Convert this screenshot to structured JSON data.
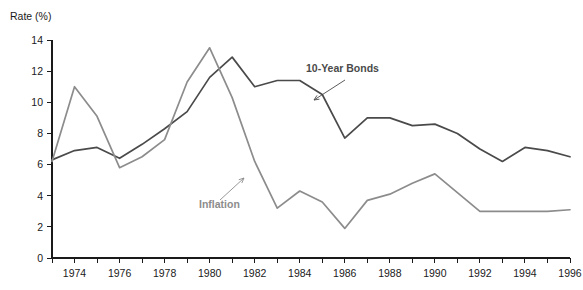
{
  "chart_data": {
    "type": "line",
    "title": "",
    "xlabel": "",
    "ylabel": "Rate (%)",
    "ylim": [
      0,
      14
    ],
    "xlim": [
      1973,
      1996
    ],
    "yticks": [
      0,
      2,
      4,
      6,
      8,
      10,
      12,
      14
    ],
    "ytick_labels": [
      "0",
      "2",
      "4",
      "6",
      "8",
      "10",
      "12",
      "14"
    ],
    "x": [
      1973,
      1974,
      1975,
      1976,
      1977,
      1978,
      1979,
      1980,
      1981,
      1982,
      1983,
      1984,
      1985,
      1986,
      1987,
      1988,
      1989,
      1990,
      1991,
      1992,
      1993,
      1994,
      1995,
      1996
    ],
    "xtick_values": [
      1973,
      1974,
      1975,
      1976,
      1977,
      1978,
      1979,
      1980,
      1981,
      1982,
      1983,
      1984,
      1985,
      1986,
      1987,
      1988,
      1989,
      1990,
      1991,
      1992,
      1993,
      1994,
      1995,
      1996
    ],
    "xtick_labels_shown": [
      "1974",
      "1976",
      "1978",
      "1980",
      "1982",
      "1984",
      "1986",
      "1988",
      "1990",
      "1992",
      "1994",
      "1996"
    ],
    "grid": false,
    "legend_position": "inline-annotation",
    "series": [
      {
        "name": "10-Year Bonds",
        "color": "#4a4a4a",
        "values": [
          6.3,
          6.9,
          7.1,
          6.4,
          7.3,
          8.3,
          9.4,
          11.6,
          12.9,
          11.0,
          11.4,
          11.4,
          10.5,
          7.7,
          9.0,
          9.0,
          8.5,
          8.6,
          8.0,
          7.0,
          6.2,
          7.1,
          6.9,
          6.5
        ]
      },
      {
        "name": "Inflation",
        "color": "#8c8c8c",
        "values": [
          6.2,
          11.0,
          9.1,
          5.8,
          6.5,
          7.6,
          11.3,
          13.5,
          10.3,
          6.2,
          3.2,
          4.3,
          3.6,
          1.9,
          3.7,
          4.1,
          4.8,
          5.4,
          4.2,
          3.0,
          3.0,
          3.0,
          3.0,
          3.1
        ]
      }
    ],
    "annotations": [
      {
        "text": "10-Year Bonds",
        "series": "10-Year Bonds",
        "label_x": 306,
        "label_y": 72,
        "arrow_from_x": 345,
        "arrow_from_y": 80,
        "arrow_to_x": 314,
        "arrow_to_y": 100,
        "color": "#4a4a4a"
      },
      {
        "text": "Inflation",
        "series": "Inflation",
        "label_x": 199,
        "label_y": 208,
        "arrow_from_x": 220,
        "arrow_from_y": 200,
        "arrow_to_x": 244,
        "arrow_to_y": 178,
        "color": "#8c8c8c"
      }
    ]
  },
  "axis": {
    "y_title": "Rate (%)"
  }
}
